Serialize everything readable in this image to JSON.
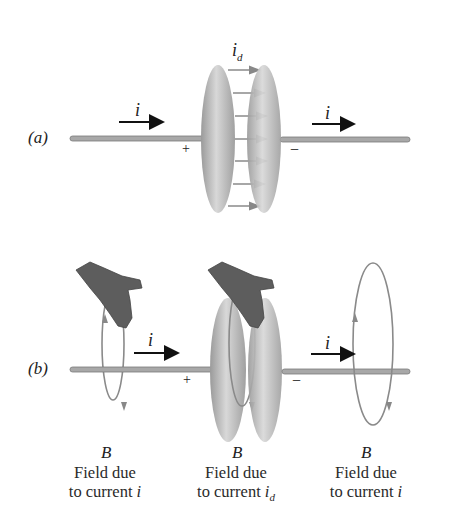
{
  "panel_a": {
    "label": "(a)",
    "current_left": "i",
    "current_right": "i",
    "displacement_current": "i",
    "displacement_sub": "d",
    "plus": "+",
    "minus": "−"
  },
  "panel_b": {
    "label": "(b)",
    "current_left": "i",
    "current_right": "i",
    "plus": "+",
    "minus": "−",
    "fields": [
      {
        "symbol": "B",
        "line1": "Field due",
        "line2": "to current",
        "var": "i",
        "sub": ""
      },
      {
        "symbol": "B",
        "line1": "Field due",
        "line2": "to current",
        "var": "i",
        "sub": "d"
      },
      {
        "symbol": "B",
        "line1": "Field due",
        "line2": "to current",
        "var": "i",
        "sub": ""
      }
    ]
  },
  "colors": {
    "wire": "#9a9a9a",
    "plate": "#8c8c8c",
    "arrow_dark": "#111111",
    "arrow_gray": "#888888",
    "hand": "#5a5a5a"
  }
}
